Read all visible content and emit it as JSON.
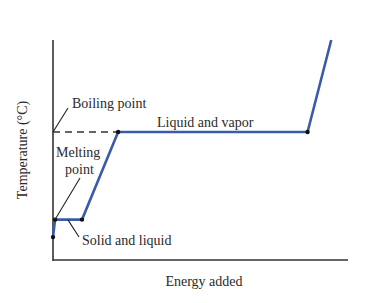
{
  "chart_data": {
    "type": "line",
    "title": "",
    "xlabel": "Energy added",
    "ylabel": "Temperature (°C)",
    "xlim": [
      0,
      100
    ],
    "ylim": [
      0,
      100
    ],
    "grid": false,
    "legend": "none",
    "series": [
      {
        "name": "Heating curve",
        "color": "#3a5bab",
        "x": [
          0,
          0.7,
          9.8,
          22,
          86,
          94
        ],
        "y": [
          10,
          18,
          18,
          58,
          58,
          100
        ]
      }
    ],
    "markers": [
      {
        "x": 0,
        "y": 10
      },
      {
        "x": 0.7,
        "y": 18
      },
      {
        "x": 9.8,
        "y": 18
      },
      {
        "x": 22,
        "y": 58
      },
      {
        "x": 86,
        "y": 58
      }
    ],
    "reference_lines": [
      {
        "name": "boiling-point-line",
        "style": "dashed",
        "y": 58,
        "x_from": 0,
        "x_to": 22
      }
    ],
    "annotations": [
      {
        "id": "boiling",
        "text": "Boiling point",
        "points_to": {
          "x": 0,
          "y": 58
        }
      },
      {
        "id": "melting",
        "lines": [
          "Melting",
          "point"
        ],
        "points_to": {
          "x": 0.7,
          "y": 18
        }
      },
      {
        "id": "solid_liquid",
        "text": "Solid and liquid",
        "points_to": {
          "x": 5,
          "y": 18
        }
      },
      {
        "id": "liquid_vapor",
        "text": "Liquid and vapor"
      }
    ]
  }
}
